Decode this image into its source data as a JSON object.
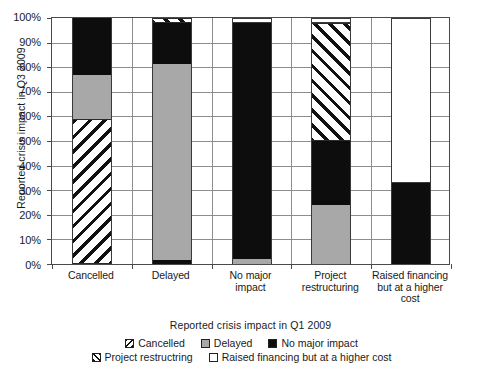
{
  "chart_data": {
    "type": "bar",
    "subtype": "100% stacked column",
    "title": "",
    "xlabel": "Reported crisis impact in Q1 2009",
    "ylabel": "Reported crisis impact in Q3 2009",
    "ylim": [
      0,
      100
    ],
    "yticks": [
      "0%",
      "10%",
      "20%",
      "30%",
      "40%",
      "50%",
      "60%",
      "70%",
      "80%",
      "90%",
      "100%"
    ],
    "ytick_values": [
      0,
      10,
      20,
      30,
      40,
      50,
      60,
      70,
      80,
      90,
      100
    ],
    "grid": true,
    "legend_position": "bottom",
    "categories": [
      "Cancelled",
      "Delayed",
      "No major impact",
      "Project restructuring",
      "Raised financing but at a higher cost"
    ],
    "category_lines": [
      [
        "Cancelled"
      ],
      [
        "Delayed"
      ],
      [
        "No major",
        "impact"
      ],
      [
        "Project",
        "restructuring"
      ],
      [
        "Raised financing",
        "but at a higher",
        "cost"
      ]
    ],
    "series": [
      {
        "name": "Cancelled",
        "pattern": "hatch-forward",
        "values": [
          59,
          0,
          0,
          0,
          0
        ]
      },
      {
        "name": "Delayed",
        "pattern": "gray",
        "values": [
          18,
          80,
          2,
          24,
          0
        ]
      },
      {
        "name": "No major impact",
        "pattern": "black",
        "values": [
          23,
          18,
          96,
          26,
          33
        ]
      },
      {
        "name": "Project restructring",
        "pattern": "hatch-back",
        "values": [
          0,
          2,
          0,
          48,
          0
        ]
      },
      {
        "name": "Raised financing but at a higher cost",
        "pattern": "white",
        "values": [
          0,
          0,
          2,
          2,
          67
        ]
      }
    ],
    "stacks": [
      {
        "category": "Cancelled",
        "segments": [
          {
            "series": "Cancelled",
            "from": 0,
            "to": 59,
            "pattern": "hatch-forward"
          },
          {
            "series": "Delayed",
            "from": 59,
            "to": 77,
            "pattern": "gray"
          },
          {
            "series": "No major impact",
            "from": 77,
            "to": 100,
            "pattern": "black"
          }
        ]
      },
      {
        "category": "Delayed",
        "segments": [
          {
            "series": "No major impact",
            "from": 0,
            "to": 1.5,
            "pattern": "black"
          },
          {
            "series": "Delayed",
            "from": 1.5,
            "to": 81.5,
            "pattern": "gray"
          },
          {
            "series": "No major impact",
            "from": 81.5,
            "to": 98,
            "pattern": "black"
          },
          {
            "series": "Project restructring",
            "from": 98,
            "to": 100,
            "pattern": "hatch-back"
          }
        ]
      },
      {
        "category": "No major impact",
        "segments": [
          {
            "series": "Delayed",
            "from": 0,
            "to": 2,
            "pattern": "gray"
          },
          {
            "series": "No major impact",
            "from": 2,
            "to": 98,
            "pattern": "black"
          },
          {
            "series": "Raised financing but at a higher cost",
            "from": 98,
            "to": 100,
            "pattern": "white"
          }
        ]
      },
      {
        "category": "Project restructuring",
        "segments": [
          {
            "series": "Delayed",
            "from": 0,
            "to": 24,
            "pattern": "gray"
          },
          {
            "series": "No major impact",
            "from": 24,
            "to": 50,
            "pattern": "black"
          },
          {
            "series": "Project restructring",
            "from": 50,
            "to": 98,
            "pattern": "hatch-back"
          },
          {
            "series": "Raised financing but at a higher cost",
            "from": 98,
            "to": 100,
            "pattern": "white"
          }
        ]
      },
      {
        "category": "Raised financing but at a higher cost",
        "segments": [
          {
            "series": "No major impact",
            "from": 0,
            "to": 33,
            "pattern": "black"
          },
          {
            "series": "Raised financing but at a higher cost",
            "from": 33,
            "to": 100,
            "pattern": "white"
          }
        ]
      }
    ],
    "legend": [
      {
        "label": "Cancelled",
        "pattern": "hatch-forward"
      },
      {
        "label": "Delayed",
        "pattern": "gray"
      },
      {
        "label": "No major impact",
        "pattern": "black"
      },
      {
        "label": "Project restructring",
        "pattern": "hatch-back"
      },
      {
        "label": "Raised financing but at a higher cost",
        "pattern": "white"
      }
    ],
    "colors": {
      "black": "#0d0d0d",
      "gray": "#a8a8a8",
      "white": "#ffffff",
      "grid": "#8d8d8d",
      "axis": "#4a4a4a",
      "text": "#1a1a1a"
    }
  }
}
